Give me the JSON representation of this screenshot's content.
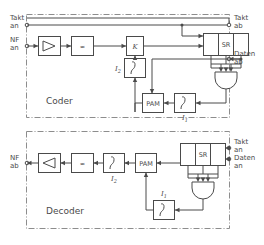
{
  "diagram": {
    "sections": [
      {
        "id": "coder",
        "label": "Coder"
      },
      {
        "id": "decoder",
        "label": "Decoder"
      }
    ],
    "terminals": {
      "coder_in_clock": {
        "line1": "Takt",
        "line2": "an"
      },
      "coder_in_audio": {
        "line1": "NF",
        "line2": "an"
      },
      "coder_out_clock": {
        "line1": "Takt",
        "line2": "ab"
      },
      "coder_out_data": {
        "line1": "Daten",
        "line2": "ab"
      },
      "decoder_out_audio": {
        "line1": "NF",
        "line2": "ab"
      },
      "decoder_in_clock": {
        "line1": "Takt",
        "line2": "an"
      },
      "decoder_in_data": {
        "line1": "Daten",
        "line2": "an"
      }
    },
    "blocks": {
      "coder_amplifier": {
        "label": "",
        "icon": "amplifier-triangle-right"
      },
      "coder_filter": {
        "label": "≈",
        "icon": "lowpass-filter"
      },
      "coder_comparator": {
        "label": "K",
        "icon": "comparator"
      },
      "coder_shiftreg": {
        "label": "SR",
        "icon": "shift-register",
        "cells": 3
      },
      "coder_andgate": {
        "label": "",
        "icon": "and-gate",
        "inputs": 3
      },
      "coder_pam": {
        "label": "PAM",
        "icon": "pam-modulator"
      },
      "coder_integrator_2": {
        "label": "∫",
        "icon": "integrator",
        "name": "I",
        "sub": "2"
      },
      "coder_integrator_1": {
        "label": "∫",
        "icon": "integrator",
        "name": "I",
        "sub": "1"
      },
      "decoder_amplifier": {
        "label": "",
        "icon": "amplifier-triangle-left"
      },
      "decoder_filter": {
        "label": "≈",
        "icon": "lowpass-filter"
      },
      "decoder_shiftreg": {
        "label": "SR",
        "icon": "shift-register",
        "cells": 3
      },
      "decoder_andgate": {
        "label": "",
        "icon": "and-gate",
        "inputs": 3
      },
      "decoder_pam": {
        "label": "PAM",
        "icon": "pam-modulator"
      },
      "decoder_integrator_2": {
        "label": "∫",
        "icon": "integrator",
        "name": "I",
        "sub": "2"
      },
      "decoder_integrator_1": {
        "label": "∫",
        "icon": "integrator",
        "name": "I",
        "sub": "1"
      }
    },
    "colors": {
      "line": "#4a4a4a",
      "frame": "#8d8d8d",
      "background": "#ffffff"
    }
  }
}
